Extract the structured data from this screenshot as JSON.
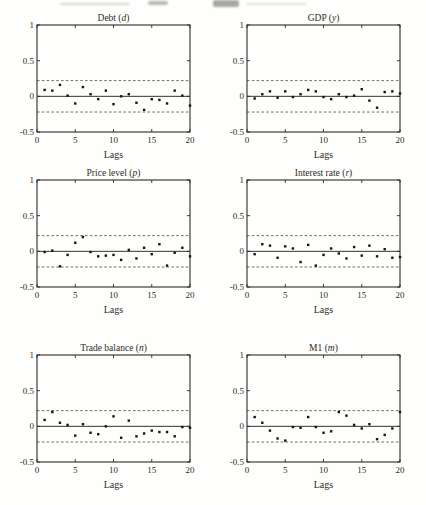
{
  "page": {
    "background": "#fefefd",
    "ink_color": "#2e2a26",
    "point_color": "#161410",
    "band_color": "#5f5b55",
    "zero_line_color": "#36332e"
  },
  "chart_data": [
    {
      "type": "scatter",
      "title": "Debt",
      "symbol": "d",
      "xlabel": "Lags",
      "xlim": [
        0,
        20
      ],
      "ylim": [
        -0.5,
        1
      ],
      "x_ticks": [
        0,
        5,
        10,
        15,
        20
      ],
      "y_ticks": [
        -0.5,
        0,
        0.5,
        1
      ],
      "conf_band": 0.22,
      "x": [
        1,
        2,
        3,
        4,
        5,
        6,
        7,
        8,
        9,
        10,
        11,
        12,
        13,
        14,
        15,
        16,
        17,
        18,
        19,
        20
      ],
      "y": [
        0.09,
        0.08,
        0.16,
        0.01,
        -0.1,
        0.13,
        0.03,
        -0.04,
        0.08,
        -0.11,
        0.0,
        0.03,
        -0.09,
        -0.19,
        -0.04,
        -0.05,
        -0.1,
        0.08,
        0.01,
        -0.13
      ]
    },
    {
      "type": "scatter",
      "title": "GDP",
      "symbol": "y",
      "xlabel": "Lags",
      "xlim": [
        0,
        20
      ],
      "ylim": [
        -0.5,
        1
      ],
      "x_ticks": [
        0,
        5,
        10,
        15,
        20
      ],
      "y_ticks": [
        -0.5,
        0,
        0.5,
        1
      ],
      "conf_band": 0.22,
      "x": [
        1,
        2,
        3,
        4,
        5,
        6,
        7,
        8,
        9,
        10,
        11,
        12,
        13,
        14,
        15,
        16,
        17,
        18,
        19,
        20
      ],
      "y": [
        -0.03,
        0.03,
        0.07,
        -0.02,
        0.07,
        -0.01,
        0.03,
        0.09,
        0.07,
        -0.01,
        -0.04,
        0.03,
        -0.01,
        0.01,
        0.1,
        -0.06,
        -0.16,
        0.06,
        0.07,
        0.04
      ]
    },
    {
      "type": "scatter",
      "title": "Price level",
      "symbol": "p",
      "xlabel": "Lags",
      "xlim": [
        0,
        20
      ],
      "ylim": [
        -0.5,
        1
      ],
      "x_ticks": [
        0,
        5,
        10,
        15,
        20
      ],
      "y_ticks": [
        -0.5,
        0,
        0.5,
        1
      ],
      "conf_band": 0.22,
      "x": [
        1,
        2,
        3,
        4,
        5,
        6,
        7,
        8,
        9,
        10,
        11,
        12,
        13,
        14,
        15,
        16,
        17,
        18,
        19,
        20
      ],
      "y": [
        -0.01,
        0.01,
        -0.21,
        -0.05,
        0.12,
        0.2,
        -0.01,
        -0.07,
        -0.06,
        -0.05,
        -0.12,
        0.02,
        -0.1,
        0.05,
        -0.04,
        0.1,
        -0.2,
        -0.02,
        0.05,
        -0.07
      ]
    },
    {
      "type": "scatter",
      "title": "Interest rate",
      "symbol": "r",
      "xlabel": "Lags",
      "xlim": [
        0,
        20
      ],
      "ylim": [
        -0.5,
        1
      ],
      "x_ticks": [
        0,
        5,
        10,
        15,
        20
      ],
      "y_ticks": [
        -0.5,
        0,
        0.5,
        1
      ],
      "conf_band": 0.22,
      "x": [
        1,
        2,
        3,
        4,
        5,
        6,
        7,
        8,
        9,
        10,
        11,
        12,
        13,
        14,
        15,
        16,
        17,
        18,
        19,
        20
      ],
      "y": [
        -0.04,
        0.1,
        0.08,
        -0.09,
        0.07,
        0.04,
        -0.15,
        0.09,
        -0.2,
        -0.05,
        0.04,
        -0.03,
        -0.1,
        0.06,
        -0.06,
        0.08,
        -0.07,
        0.03,
        -0.09,
        -0.08
      ]
    },
    {
      "type": "scatter",
      "title": "Trade balance",
      "symbol": "n",
      "xlabel": "Lags",
      "xlim": [
        0,
        20
      ],
      "ylim": [
        -0.5,
        1
      ],
      "x_ticks": [
        0,
        5,
        10,
        15,
        20
      ],
      "y_ticks": [
        -0.5,
        0,
        0.5,
        1
      ],
      "conf_band": 0.22,
      "x": [
        1,
        2,
        3,
        4,
        5,
        6,
        7,
        8,
        9,
        10,
        11,
        12,
        13,
        14,
        15,
        16,
        17,
        18,
        19,
        20
      ],
      "y": [
        0.09,
        0.2,
        0.05,
        0.02,
        -0.13,
        0.03,
        -0.09,
        -0.11,
        0.0,
        0.14,
        -0.16,
        0.08,
        -0.14,
        -0.1,
        -0.06,
        -0.08,
        -0.08,
        -0.14,
        -0.01,
        -0.02
      ]
    },
    {
      "type": "scatter",
      "title": "M1",
      "symbol": "m",
      "xlabel": "Lags",
      "xlim": [
        0,
        20
      ],
      "ylim": [
        -0.5,
        1
      ],
      "x_ticks": [
        0,
        5,
        10,
        15,
        20
      ],
      "y_ticks": [
        -0.5,
        0,
        0.5,
        1
      ],
      "conf_band": 0.22,
      "x": [
        1,
        2,
        3,
        4,
        5,
        6,
        7,
        8,
        9,
        10,
        11,
        12,
        13,
        14,
        15,
        16,
        17,
        18,
        19,
        20
      ],
      "y": [
        0.13,
        0.05,
        -0.06,
        -0.17,
        -0.2,
        -0.01,
        -0.02,
        0.13,
        -0.01,
        -0.09,
        -0.07,
        0.2,
        0.15,
        0.02,
        -0.03,
        0.03,
        -0.18,
        -0.12,
        -0.03,
        0.2
      ]
    }
  ]
}
